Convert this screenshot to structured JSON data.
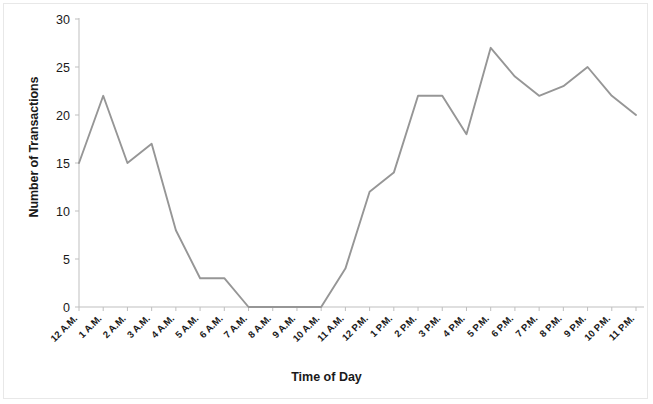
{
  "chart_data": {
    "type": "line",
    "title": "",
    "xlabel": "Time of Day",
    "ylabel": "Number of Transactions",
    "categories": [
      "12 A.M.",
      "1 A.M.",
      "2 A.M.",
      "3 A.M.",
      "4 A.M.",
      "5 A.M.",
      "6 A.M.",
      "7 A.M.",
      "8 A.M.",
      "9 A.M.",
      "10 A.M.",
      "11 A.M.",
      "12 P.M.",
      "1 P.M.",
      "2 P.M.",
      "3 P.M.",
      "4 P.M.",
      "5 P.M.",
      "6 P.M.",
      "7 P.M.",
      "8 P.M.",
      "9 P.M.",
      "10 P.M.",
      "11 P.M."
    ],
    "values": [
      15,
      22,
      15,
      17,
      8,
      3,
      3,
      0,
      0,
      0,
      0,
      4,
      12,
      14,
      22,
      22,
      18,
      27,
      24,
      22,
      23,
      25,
      22,
      20
    ],
    "series": [
      {
        "name": "Number of Transactions",
        "values": [
          15,
          22,
          15,
          17,
          8,
          3,
          3,
          0,
          0,
          0,
          0,
          4,
          12,
          14,
          22,
          22,
          18,
          27,
          24,
          22,
          23,
          25,
          22,
          20
        ]
      }
    ],
    "ylim": [
      0,
      30
    ],
    "yticks": [
      0,
      5,
      10,
      15,
      20,
      25,
      30
    ],
    "ytick_labels": [
      "0",
      "5",
      "10",
      "15",
      "20",
      "25",
      "30"
    ],
    "grid": false,
    "legend": false,
    "line_color": "#969696",
    "axis_color": "#bfbfbf",
    "text_color": "#1a1a1a",
    "background_color": "#ffffff"
  }
}
